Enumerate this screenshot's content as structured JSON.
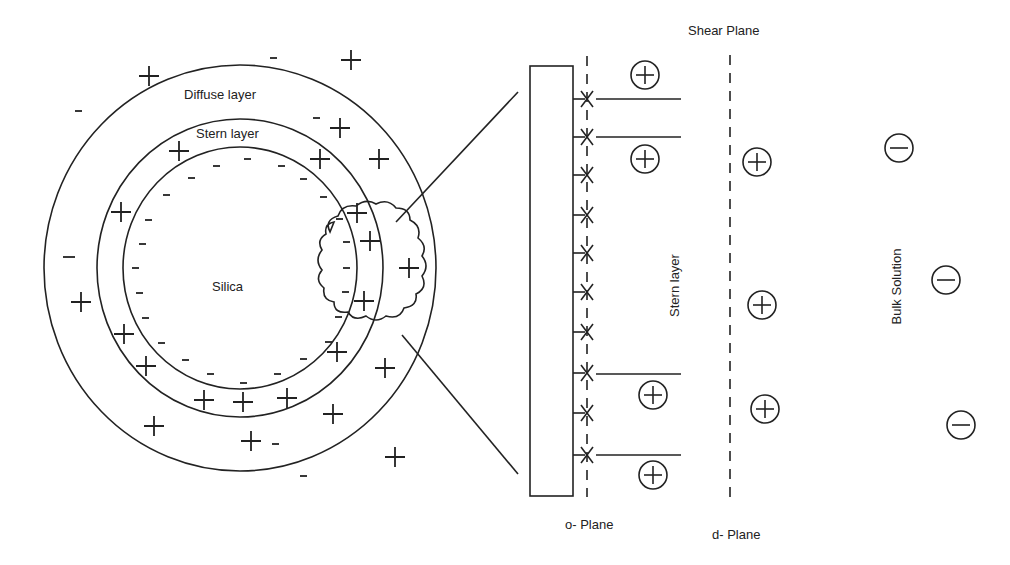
{
  "diagram": {
    "type": "electric double layer around silica particle",
    "labels": {
      "diffuse_layer": "Diffuse layer",
      "stern_layer_circle": "Stern layer",
      "silica": "Silica",
      "shear_plane": "Shear Plane",
      "stern_layer_vertical": "Stern layer",
      "bulk_solution": "Bulk Solution",
      "o_plane": "o- Plane",
      "d_plane": "d- Plane"
    },
    "colors": {
      "stroke": "#222222",
      "background": "#ffffff"
    },
    "particle": {
      "regions": [
        "Silica",
        "Stern layer",
        "Diffuse layer"
      ],
      "surface_charge": "-",
      "stern_charge": "+",
      "diffuse_charges": [
        "+",
        "-"
      ]
    },
    "zoom_detail": {
      "surface_sites": 10,
      "stern_layer_cations": 4,
      "diffuse_layer_cations": 3,
      "bulk_anions": 3
    }
  }
}
